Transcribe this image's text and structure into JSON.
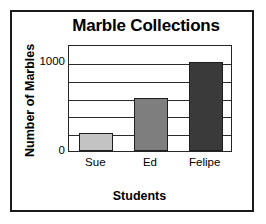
{
  "chart_data": {
    "type": "bar",
    "title": "Marble Collections",
    "xlabel": "Students",
    "ylabel": "Number of Marbles",
    "categories": [
      "Sue",
      "Ed",
      "Felipe"
    ],
    "values": [
      200,
      600,
      1000
    ],
    "series": [
      {
        "name": "Number of Marbles",
        "values": [
          200,
          600,
          1000
        ]
      }
    ],
    "ylim": [
      0,
      1200
    ],
    "yticks": [
      0,
      1000
    ],
    "ytick_labels": [
      "0",
      "1000"
    ],
    "gridlines_y": [
      200,
      400,
      600,
      800,
      1000
    ],
    "grid": true,
    "legend": false,
    "legend_position": "none",
    "bar_colors": [
      "#c3c3c3",
      "#7e7e7e",
      "#3a3a3a"
    ],
    "bar_edge_color": "#1f1f1f",
    "axis_color": "#262626",
    "frame_color": "#1a1a1a",
    "background": "#ffffff"
  }
}
